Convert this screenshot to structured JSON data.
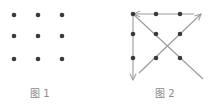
{
  "figures": [
    {
      "caption": "图 1",
      "dots": [
        [
          14,
          15
        ],
        [
          38,
          15
        ],
        [
          62,
          15
        ],
        [
          14,
          36
        ],
        [
          38,
          36
        ],
        [
          62,
          36
        ],
        [
          14,
          59
        ],
        [
          38,
          59
        ],
        [
          62,
          59
        ]
      ]
    },
    {
      "caption": "图 2",
      "dots": [
        [
          133,
          14
        ],
        [
          156,
          14
        ],
        [
          180,
          14
        ],
        [
          133,
          34
        ],
        [
          156,
          34
        ],
        [
          180,
          34
        ],
        [
          133,
          58
        ],
        [
          156,
          58
        ],
        [
          180,
          58
        ]
      ],
      "paths": [
        {
          "name": "top-line-arrow-left",
          "from": [
            194,
            14
          ],
          "to": [
            134,
            14
          ]
        },
        {
          "name": "diagonal-down-right",
          "from": [
            133,
            14
          ],
          "to": [
            203,
            79
          ]
        },
        {
          "name": "diagonal-up-right-arrow",
          "from": [
            139,
            73
          ],
          "to": [
            201,
            14
          ]
        },
        {
          "name": "vertical-line-arrow-down",
          "from": [
            133,
            14
          ],
          "to": [
            133,
            80
          ]
        }
      ]
    }
  ],
  "colors": {
    "dot": "#3a3a3a",
    "line": "#9a9a9a",
    "caption": "#8a8a8a"
  }
}
